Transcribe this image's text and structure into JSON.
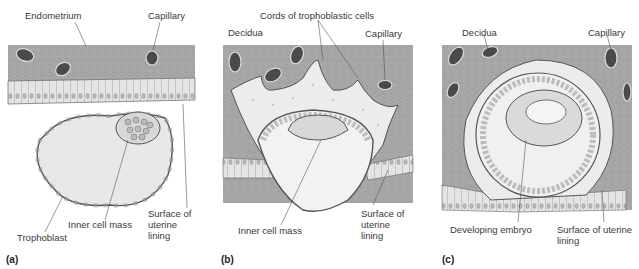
{
  "figure": {
    "panels": [
      {
        "id": "a",
        "panel_label": "(a)",
        "labels": {
          "endometrium": "Endometrium",
          "capillary": "Capillary",
          "inner_cell_mass": "Inner cell mass",
          "trophoblast": "Trophoblast",
          "surface": "Surface of uterine lining"
        }
      },
      {
        "id": "b",
        "panel_label": "(b)",
        "labels": {
          "cords": "Cords of trophoblastic cells",
          "decidua": "Decidua",
          "capillary": "Capillary",
          "inner_cell_mass": "Inner cell mass",
          "surface": "Surface of uterine lining"
        }
      },
      {
        "id": "c",
        "panel_label": "(c)",
        "labels": {
          "decidua": "Decidua",
          "capillary": "Capillary",
          "developing_embryo": "Developing embryo",
          "surface": "Surface of uterine lining"
        }
      }
    ],
    "colors": {
      "tissue": "#a8a8a8",
      "tissue_dark": "#8c8c8c",
      "lining": "#e2e2e2",
      "capillary": "#4a4a4a",
      "cavity": "#f2f2f2",
      "trophoblast_fill": "#ebebeb",
      "outline": "#555555"
    }
  }
}
